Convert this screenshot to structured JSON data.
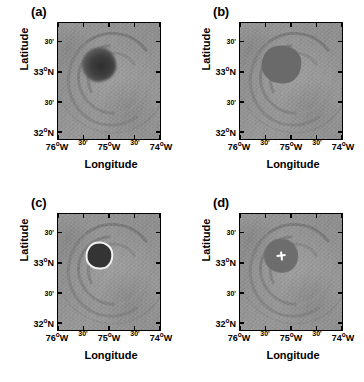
{
  "figure": {
    "title": "",
    "panel_count": 4,
    "axis_titles": {
      "x": "Longitude",
      "y": "Latitude"
    }
  },
  "axes": {
    "xticks": [
      {
        "label": "76",
        "unit": "o",
        "hemi": "W",
        "type": "major",
        "value": -76.0,
        "pos": 0
      },
      {
        "label": "30'",
        "type": "minor",
        "value": -75.5,
        "pos": 25
      },
      {
        "label": "75",
        "unit": "o",
        "hemi": "W",
        "type": "major",
        "value": -75.0,
        "pos": 50
      },
      {
        "label": "30'",
        "type": "minor",
        "value": -74.5,
        "pos": 75
      },
      {
        "label": "74",
        "unit": "o",
        "hemi": "W",
        "type": "major",
        "value": -74.0,
        "pos": 100
      }
    ],
    "yticks": [
      {
        "label": "30'",
        "type": "minor",
        "value": 33.5,
        "pos": 16
      },
      {
        "label": "33",
        "unit": "o",
        "hemi": "N",
        "type": "major",
        "value": 33.0,
        "pos": 42
      },
      {
        "label": "30'",
        "type": "minor",
        "value": 32.5,
        "pos": 68
      },
      {
        "label": "32",
        "unit": "o",
        "hemi": "N",
        "type": "major",
        "value": 32.0,
        "pos": 94
      }
    ],
    "xlim": [
      -76.25,
      -73.75
    ],
    "ylim": [
      31.85,
      33.75
    ],
    "grid": false
  },
  "chart_data": {
    "type": "heatmap",
    "title": "",
    "xlabel": "Longitude",
    "ylabel": "Latitude",
    "xlim": [
      -76.25,
      -73.75
    ],
    "ylim": [
      31.85,
      33.75
    ],
    "grid": false,
    "legend": "none",
    "colormap": "grayscale",
    "projection_note": "rotated satellite swath",
    "swath_rotation_deg": -6.5,
    "xtick_labels": [
      "76°W",
      "30'",
      "75°W",
      "30'",
      "74°W"
    ],
    "xtick_values": [
      -76.0,
      -75.5,
      -75.0,
      -74.5,
      -74.0
    ],
    "ytick_labels": [
      "30'",
      "33°N",
      "30'",
      "32°N"
    ],
    "ytick_values": [
      33.5,
      33.0,
      32.5,
      32.0
    ],
    "panels": [
      {
        "label": "(a)",
        "description": "original grayscale hurricane image",
        "eye_center": {
          "lon": -75.1,
          "lat": 33.05
        },
        "eye_fill": "#3d3d3d",
        "overlay": "none"
      },
      {
        "label": "(b)",
        "description": "segmented eye region filled uniform gray",
        "eye_center": {
          "lon": -75.1,
          "lat": 33.05
        },
        "eye_fill": "#6a6a6a",
        "overlay": "flat-region"
      },
      {
        "label": "(c)",
        "description": "eye boundary traced with white contour",
        "eye_center": {
          "lon": -75.1,
          "lat": 33.05
        },
        "eye_fill": "#343434",
        "overlay": "white-contour"
      },
      {
        "label": "(d)",
        "description": "eye center marked with white cross",
        "eye_center": {
          "lon": -75.1,
          "lat": 33.05
        },
        "eye_fill": "#6d6d6d",
        "overlay": "white-cross"
      }
    ]
  },
  "colors": {
    "background": "#ffffff",
    "axis": "#000000",
    "text": "#000000",
    "contour": "#f2f2f2",
    "marker": "#ffffff",
    "swath_mid": "#929292"
  }
}
